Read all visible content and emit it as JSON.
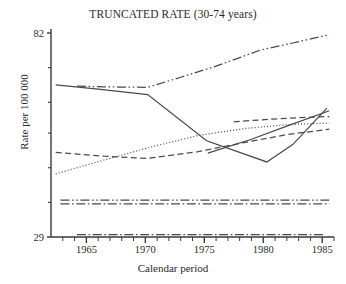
{
  "chart_data": {
    "type": "line",
    "title": "TRUNCATED RATE (30-74 years)",
    "xlabel": "Calendar period",
    "ylabel": "Rate per 100 000",
    "xlim": [
      1962,
      1986
    ],
    "ylim": [
      29,
      82
    ],
    "grid": false,
    "legend": "none",
    "xticks": [
      "1965",
      "1970",
      "1975",
      "1980",
      "1985"
    ],
    "xtick_values": [
      1965,
      1970,
      1975,
      1980,
      1985
    ],
    "yticks": [
      "29",
      "82"
    ],
    "ytick_values": [
      29,
      82
    ],
    "ytick_minor_values": [
      38,
      47,
      56,
      64,
      73
    ],
    "xtick_minor_step": 1,
    "series": [
      {
        "name": "series-1-rising-dashdotdot",
        "style": "dash-dot-dot",
        "x": [
          1964.2,
          1966.5,
          1970.2,
          1973.0,
          1976.0,
          1979.8,
          1982.5,
          1985.6
        ],
        "y": [
          68.2,
          68.0,
          67.9,
          70.5,
          73.4,
          77.6,
          79.4,
          81.6
        ]
      },
      {
        "name": "series-2-declining-then-rising-solid",
        "style": "solid",
        "x": [
          1962.4,
          1966.0,
          1970.2,
          1975.2,
          1980.3,
          1982.5,
          1985.4
        ],
        "y": [
          68.5,
          67.4,
          66.0,
          54.0,
          48.5,
          53.0,
          62.5
        ]
      },
      {
        "name": "series-3-dotted-rising",
        "style": "dotted",
        "x": [
          1962.4,
          1966.5,
          1970.5,
          1974.5,
          1978.5,
          1982.0,
          1985.6
        ],
        "y": [
          45.4,
          49.0,
          52.4,
          55.4,
          57.2,
          58.2,
          58.6
        ]
      },
      {
        "name": "series-4-dashed-lower",
        "style": "dashed",
        "x": [
          1962.4,
          1966.5,
          1970.2,
          1974.5,
          1978.5,
          1982.0,
          1985.6
        ],
        "y": [
          51.0,
          50.0,
          49.4,
          51.2,
          53.6,
          55.6,
          57.0
        ]
      },
      {
        "name": "series-5-dashed-upper-short",
        "style": "dashed",
        "x": [
          1977.5,
          1980.5,
          1983.0,
          1985.6
        ],
        "y": [
          58.9,
          59.6,
          60.0,
          60.3
        ]
      },
      {
        "name": "series-6-solid-steady-rise",
        "style": "solid",
        "x": [
          1975.3,
          1979.0,
          1982.0,
          1985.6
        ],
        "y": [
          50.8,
          54.4,
          57.8,
          61.8
        ]
      },
      {
        "name": "series-7-flat-upper-dashdotdot",
        "style": "dash-dot-dot",
        "x": [
          1962.8,
          1985.6
        ],
        "y": [
          38.6,
          38.6
        ]
      },
      {
        "name": "series-8-flat-lower-dashdot",
        "style": "dash-dot",
        "x": [
          1962.8,
          1985.6
        ],
        "y": [
          37.6,
          37.6
        ]
      },
      {
        "name": "series-9-flat-bottom-dashdot",
        "style": "dash-dot",
        "x": [
          1964.2,
          1985.2
        ],
        "y": [
          29.6,
          29.6
        ]
      }
    ],
    "colors": {
      "axis": "#3a3a3a",
      "line": "#4a4a4a",
      "text": "#2b2b2b",
      "background": "#ffffff"
    }
  }
}
